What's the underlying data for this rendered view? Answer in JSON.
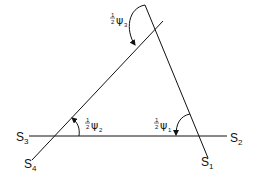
{
  "diagram": {
    "type": "geometric-triangle-with-angles",
    "lines": [
      {
        "id": "S3-S2",
        "from_label": "S3",
        "to_label": "S2"
      },
      {
        "id": "S4",
        "label": "S4"
      },
      {
        "id": "S1",
        "label": "S1"
      }
    ],
    "labels": {
      "s1": {
        "base": "S",
        "sub": "1"
      },
      "s2": {
        "base": "S",
        "sub": "2"
      },
      "s3": {
        "base": "S",
        "sub": "3"
      },
      "s4": {
        "base": "S",
        "sub": "4"
      }
    },
    "angles": {
      "psi1": {
        "coef_num": "1",
        "coef_den": "2",
        "symbol": "ψ",
        "sub": "1"
      },
      "psi2": {
        "coef_num": "1",
        "coef_den": "2",
        "symbol": "ψ",
        "sub": "2"
      },
      "psi3": {
        "coef_num": "1",
        "coef_den": "2",
        "symbol": "ψ",
        "sub": "3"
      }
    },
    "colors": {
      "stroke": "#111111",
      "background": "#ffffff"
    }
  }
}
